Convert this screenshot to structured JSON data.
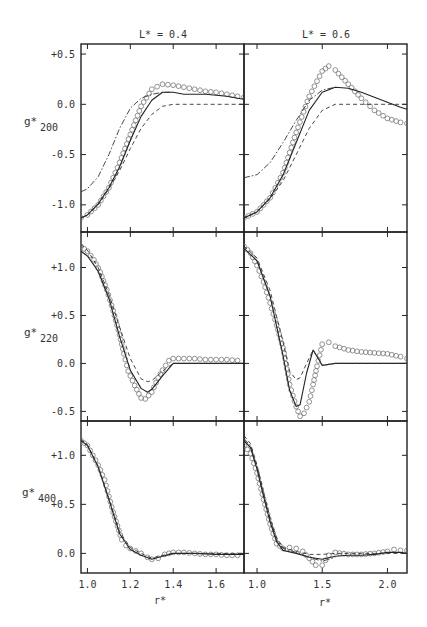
{
  "figure": {
    "column_titles": [
      "L* = 0.4",
      "L* = 0.6"
    ],
    "x_label": "r*",
    "row_labels": [
      {
        "main": "g*",
        "sub": "200"
      },
      {
        "main": "g*",
        "sub": "220"
      },
      {
        "main": "g*",
        "sub": "400"
      }
    ]
  },
  "chart_data": {
    "type": "line",
    "title": "",
    "layout": {
      "grid": false,
      "rows": 3,
      "cols": 2,
      "legend": "none",
      "line_styles": {
        "circles": "open circles (simulation)",
        "solid": "solid line",
        "dashed": "dashed line",
        "dashdot": "dash-dot line"
      }
    },
    "panels": [
      {
        "id": "g200_L04",
        "row": 0,
        "col": 0,
        "xlabel": "r*",
        "ylabel": "g*200",
        "xlim": [
          0.97,
          1.73
        ],
        "ylim": [
          -1.27,
          0.6
        ],
        "xticks": [
          1.0,
          1.2,
          1.4,
          1.6
        ],
        "yticks": [
          0.5,
          0.0,
          -0.5,
          -1.0
        ],
        "ytick_labels": [
          "+0.5",
          "0.0",
          "-0.5",
          "-1.0"
        ],
        "series": [
          {
            "name": "circles",
            "x": [
              0.97,
              1.0,
              1.05,
              1.1,
              1.15,
              1.2,
              1.25,
              1.3,
              1.35,
              1.4,
              1.45,
              1.5,
              1.55,
              1.6,
              1.65,
              1.7,
              1.73
            ],
            "y": [
              -1.13,
              -1.1,
              -1.0,
              -0.83,
              -0.58,
              -0.3,
              -0.02,
              0.15,
              0.2,
              0.19,
              0.17,
              0.15,
              0.13,
              0.12,
              0.1,
              0.08,
              0.07
            ]
          },
          {
            "name": "solid",
            "x": [
              0.97,
              1.0,
              1.05,
              1.1,
              1.15,
              1.2,
              1.25,
              1.3,
              1.35,
              1.4,
              1.45,
              1.5,
              1.55,
              1.6,
              1.65,
              1.7,
              1.73
            ],
            "y": [
              -1.13,
              -1.1,
              -0.99,
              -0.83,
              -0.62,
              -0.36,
              -0.12,
              0.04,
              0.12,
              0.12,
              0.1,
              0.1,
              0.1,
              0.09,
              0.08,
              0.06,
              0.05
            ]
          },
          {
            "name": "dashed",
            "x": [
              0.97,
              1.0,
              1.05,
              1.1,
              1.15,
              1.2,
              1.25,
              1.3,
              1.35,
              1.4,
              1.45,
              1.5,
              1.55,
              1.6,
              1.65,
              1.7,
              1.73
            ],
            "y": [
              -1.13,
              -1.1,
              -1.0,
              -0.84,
              -0.66,
              -0.44,
              -0.24,
              -0.1,
              -0.02,
              0.0,
              0.0,
              0.0,
              0.0,
              0.0,
              0.0,
              0.0,
              0.0
            ]
          },
          {
            "name": "dashdot",
            "x": [
              0.97,
              1.0,
              1.05,
              1.1,
              1.15,
              1.2,
              1.25,
              1.3,
              1.35,
              1.4
            ],
            "y": [
              -0.87,
              -0.84,
              -0.72,
              -0.5,
              -0.24,
              -0.04,
              0.06,
              0.1,
              0.12,
              0.12
            ]
          }
        ]
      },
      {
        "id": "g200_L06",
        "row": 0,
        "col": 1,
        "xlabel": "r*",
        "ylabel": "g*200",
        "xlim": [
          0.9,
          2.15
        ],
        "ylim": [
          -1.27,
          0.6
        ],
        "xticks": [
          1.0,
          1.5,
          2.0
        ],
        "yticks": [
          0.5,
          0.0,
          -0.5,
          -1.0
        ],
        "series": [
          {
            "name": "circles",
            "x": [
              0.9,
              1.0,
              1.1,
              1.2,
              1.3,
              1.4,
              1.5,
              1.55,
              1.6,
              1.7,
              1.8,
              1.9,
              2.0,
              2.1,
              2.15
            ],
            "y": [
              -1.13,
              -1.07,
              -0.93,
              -0.68,
              -0.28,
              0.08,
              0.33,
              0.38,
              0.34,
              0.2,
              0.06,
              -0.06,
              -0.14,
              -0.18,
              -0.19
            ]
          },
          {
            "name": "solid",
            "x": [
              0.9,
              1.0,
              1.1,
              1.2,
              1.3,
              1.4,
              1.5,
              1.6,
              1.7,
              1.8,
              1.9,
              2.0,
              2.1,
              2.15
            ],
            "y": [
              -1.13,
              -1.07,
              -0.93,
              -0.7,
              -0.38,
              -0.06,
              0.12,
              0.17,
              0.16,
              0.12,
              0.07,
              0.02,
              -0.03,
              -0.05
            ]
          },
          {
            "name": "dashed",
            "x": [
              0.9,
              1.0,
              1.1,
              1.2,
              1.3,
              1.4,
              1.5,
              1.6,
              1.7,
              1.8,
              1.9,
              2.0,
              2.1,
              2.15
            ],
            "y": [
              -1.13,
              -1.07,
              -0.94,
              -0.76,
              -0.5,
              -0.24,
              -0.06,
              0.0,
              0.0,
              0.0,
              0.0,
              0.0,
              0.0,
              0.0
            ]
          },
          {
            "name": "dashdot",
            "x": [
              0.9,
              1.0,
              1.1,
              1.2,
              1.3,
              1.4,
              1.5,
              1.6
            ],
            "y": [
              -0.73,
              -0.7,
              -0.58,
              -0.38,
              -0.16,
              0.04,
              0.14,
              0.17
            ]
          }
        ]
      },
      {
        "id": "g220_L04",
        "row": 1,
        "col": 0,
        "xlabel": "r*",
        "ylabel": "g*220",
        "xlim": [
          0.97,
          1.73
        ],
        "ylim": [
          -0.6,
          1.37
        ],
        "xticks": [
          1.0,
          1.2,
          1.4,
          1.6
        ],
        "yticks": [
          1.0,
          0.5,
          0.0,
          -0.5
        ],
        "ytick_labels": [
          "+1.0",
          "+0.5",
          "0.0",
          "-0.5"
        ],
        "series": [
          {
            "name": "circles",
            "x": [
              0.97,
              1.0,
              1.03,
              1.06,
              1.09,
              1.12,
              1.15,
              1.17,
              1.19,
              1.22,
              1.25,
              1.27,
              1.3,
              1.33,
              1.35,
              1.38,
              1.4,
              1.45,
              1.5,
              1.55,
              1.6,
              1.65,
              1.7
            ],
            "y": [
              1.22,
              1.17,
              1.08,
              0.95,
              0.77,
              0.55,
              0.3,
              0.1,
              -0.08,
              -0.23,
              -0.36,
              -0.37,
              -0.3,
              -0.15,
              -0.07,
              0.03,
              0.05,
              0.05,
              0.05,
              0.04,
              0.04,
              0.04,
              0.03
            ]
          },
          {
            "name": "solid",
            "x": [
              0.97,
              1.0,
              1.05,
              1.1,
              1.15,
              1.2,
              1.25,
              1.28,
              1.3,
              1.35,
              1.4,
              1.45,
              1.5,
              1.6,
              1.7,
              1.73
            ],
            "y": [
              1.17,
              1.12,
              0.96,
              0.68,
              0.28,
              -0.07,
              -0.26,
              -0.3,
              -0.27,
              -0.13,
              0.0,
              0.0,
              0.0,
              0.0,
              0.0,
              0.0
            ]
          },
          {
            "name": "dashed",
            "x": [
              0.97,
              1.0,
              1.05,
              1.1,
              1.15,
              1.2,
              1.25,
              1.28,
              1.3,
              1.35,
              1.4,
              1.45,
              1.5,
              1.6,
              1.7,
              1.73
            ],
            "y": [
              1.24,
              1.18,
              1.0,
              0.72,
              0.38,
              0.05,
              -0.16,
              -0.19,
              -0.18,
              -0.08,
              0.0,
              0.0,
              0.0,
              0.0,
              0.0,
              0.0
            ]
          }
        ]
      },
      {
        "id": "g220_L06",
        "row": 1,
        "col": 1,
        "xlabel": "r*",
        "ylabel": "g*220",
        "xlim": [
          0.9,
          2.15
        ],
        "ylim": [
          -0.6,
          1.37
        ],
        "xticks": [
          1.0,
          1.5,
          2.0
        ],
        "yticks": [
          1.0,
          0.5,
          0.0,
          -0.5
        ],
        "series": [
          {
            "name": "circles",
            "x": [
              0.9,
              0.95,
              1.0,
              1.05,
              1.1,
              1.15,
              1.2,
              1.25,
              1.3,
              1.33,
              1.36,
              1.4,
              1.43,
              1.46,
              1.5,
              1.55,
              1.6,
              1.7,
              1.8,
              1.9,
              2.0,
              2.1,
              2.15
            ],
            "y": [
              1.22,
              1.15,
              1.02,
              0.85,
              0.63,
              0.4,
              0.16,
              -0.22,
              -0.45,
              -0.55,
              -0.52,
              -0.4,
              -0.22,
              -0.03,
              0.2,
              0.22,
              0.18,
              0.14,
              0.12,
              0.11,
              0.1,
              0.07,
              0.05
            ]
          },
          {
            "name": "solid",
            "x": [
              0.9,
              1.0,
              1.1,
              1.2,
              1.25,
              1.3,
              1.33,
              1.38,
              1.43,
              1.47,
              1.5,
              1.6,
              1.8,
              2.0,
              2.15
            ],
            "y": [
              1.2,
              1.07,
              0.7,
              0.08,
              -0.28,
              -0.45,
              -0.43,
              -0.1,
              0.14,
              0.05,
              -0.02,
              0.0,
              0.0,
              0.0,
              0.0
            ]
          },
          {
            "name": "dashed",
            "x": [
              0.9,
              1.0,
              1.1,
              1.2,
              1.25,
              1.3,
              1.33,
              1.38,
              1.43,
              1.47,
              1.5,
              1.6,
              1.8,
              2.0,
              2.15
            ],
            "y": [
              1.22,
              1.1,
              0.76,
              0.22,
              -0.08,
              -0.17,
              -0.15,
              0.0,
              0.14,
              0.05,
              -0.02,
              0.0,
              0.0,
              0.0,
              0.0
            ]
          }
        ]
      },
      {
        "id": "g400_L04",
        "row": 2,
        "col": 0,
        "xlabel": "r*",
        "ylabel": "g*400",
        "xlim": [
          0.97,
          1.73
        ],
        "ylim": [
          -0.2,
          1.35
        ],
        "xticks": [
          1.0,
          1.2,
          1.4,
          1.6
        ],
        "xtick_labels": [
          "1.0",
          "1.2",
          "1.4",
          "1.6"
        ],
        "yticks": [
          1.0,
          0.5,
          0.0
        ],
        "ytick_labels": [
          "+1.0",
          "+0.5",
          "0.0"
        ],
        "series": [
          {
            "name": "circles",
            "x": [
              0.97,
              1.0,
              1.05,
              1.08,
              1.1,
              1.12,
              1.14,
              1.16,
              1.18,
              1.2,
              1.25,
              1.28,
              1.3,
              1.33,
              1.36,
              1.4,
              1.45,
              1.5,
              1.55,
              1.6,
              1.65,
              1.7
            ],
            "y": [
              1.15,
              1.1,
              0.9,
              0.75,
              0.58,
              0.42,
              0.28,
              0.14,
              0.08,
              0.05,
              0.0,
              -0.04,
              -0.06,
              -0.05,
              -0.01,
              0.01,
              0.01,
              0.0,
              -0.01,
              -0.01,
              -0.02,
              -0.02
            ]
          },
          {
            "name": "solid",
            "x": [
              0.97,
              1.0,
              1.05,
              1.1,
              1.15,
              1.2,
              1.25,
              1.3,
              1.35,
              1.4,
              1.5,
              1.6,
              1.73
            ],
            "y": [
              1.15,
              1.1,
              0.88,
              0.55,
              0.2,
              0.04,
              -0.02,
              -0.06,
              -0.03,
              0.0,
              0.0,
              -0.01,
              -0.01
            ]
          },
          {
            "name": "dashed",
            "x": [
              0.97,
              1.0,
              1.05,
              1.1,
              1.15,
              1.2,
              1.25,
              1.3,
              1.35,
              1.4,
              1.5,
              1.6,
              1.73
            ],
            "y": [
              1.16,
              1.11,
              0.89,
              0.56,
              0.22,
              0.06,
              0.0,
              -0.05,
              -0.02,
              0.0,
              0.0,
              0.0,
              0.0
            ]
          }
        ]
      },
      {
        "id": "g400_L06",
        "row": 2,
        "col": 1,
        "xlabel": "r*",
        "ylabel": "g*400",
        "xlim": [
          0.9,
          2.15
        ],
        "ylim": [
          -0.2,
          1.35
        ],
        "xticks": [
          1.0,
          1.5,
          2.0
        ],
        "xtick_labels": [
          "1.0",
          "1.5",
          "2.0"
        ],
        "yticks": [
          1.0,
          0.5,
          0.0
        ],
        "series": [
          {
            "name": "circles",
            "x": [
              0.9,
              0.95,
              1.0,
              1.05,
              1.1,
              1.15,
              1.2,
              1.25,
              1.3,
              1.35,
              1.4,
              1.45,
              1.5,
              1.55,
              1.6,
              1.7,
              1.8,
              1.9,
              2.0,
              2.05,
              2.1,
              2.15
            ],
            "y": [
              1.1,
              1.02,
              0.82,
              0.55,
              0.3,
              0.1,
              0.05,
              0.06,
              0.05,
              0.02,
              -0.05,
              -0.12,
              -0.12,
              -0.02,
              0.01,
              -0.01,
              -0.01,
              0.0,
              0.02,
              0.04,
              0.03,
              0.03
            ]
          },
          {
            "name": "solid",
            "x": [
              0.9,
              0.95,
              1.0,
              1.05,
              1.1,
              1.15,
              1.2,
              1.3,
              1.4,
              1.5,
              1.6,
              1.7,
              1.8,
              1.9,
              2.0,
              2.1,
              2.15
            ],
            "y": [
              1.15,
              1.08,
              0.86,
              0.58,
              0.32,
              0.12,
              0.03,
              0.0,
              -0.04,
              -0.06,
              -0.03,
              -0.02,
              -0.02,
              -0.01,
              0.01,
              0.01,
              0.0
            ]
          },
          {
            "name": "dashed",
            "x": [
              0.9,
              0.95,
              1.0,
              1.05,
              1.1,
              1.15,
              1.2,
              1.3,
              1.4,
              1.5,
              1.6,
              1.7,
              1.8,
              1.9,
              2.0,
              2.1,
              2.15
            ],
            "y": [
              1.2,
              1.12,
              0.9,
              0.62,
              0.36,
              0.16,
              0.06,
              0.02,
              -0.01,
              -0.01,
              0.0,
              0.0,
              0.0,
              0.0,
              0.0,
              0.0,
              0.0
            ]
          },
          {
            "name": "dashdot",
            "x": [
              0.9,
              0.95,
              1.0,
              1.05,
              1.1,
              1.15,
              1.2,
              1.3,
              1.4,
              1.5,
              1.6
            ],
            "y": [
              1.17,
              1.1,
              0.88,
              0.6,
              0.34,
              0.14,
              0.05,
              0.01,
              -0.04,
              -0.08,
              -0.04
            ]
          }
        ]
      }
    ]
  }
}
